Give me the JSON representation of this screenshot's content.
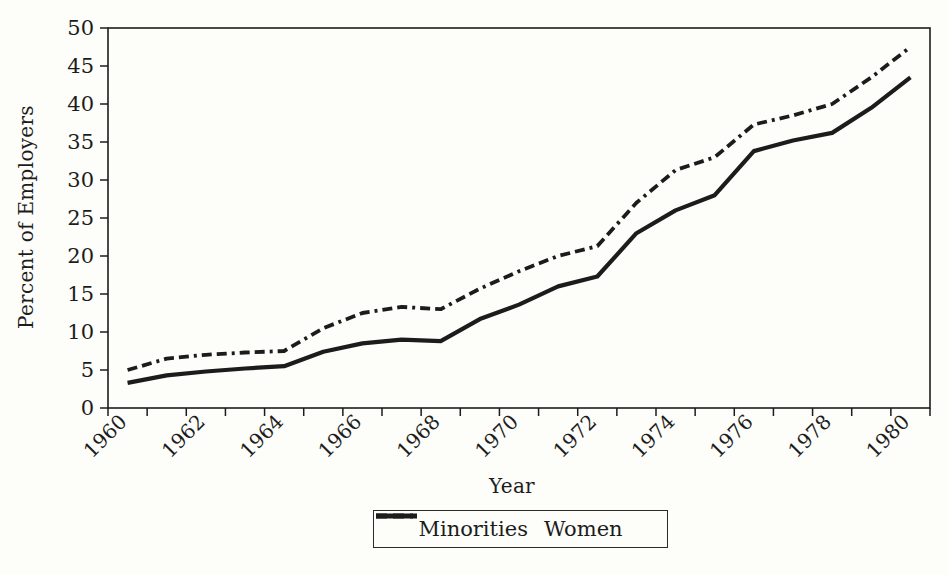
{
  "page": {
    "background": "#fdfdfa",
    "ink_color": "#1c1c1c"
  },
  "chart_data": {
    "type": "line",
    "title": "",
    "xlabel": "Year",
    "ylabel": "Percent of Employers",
    "x": [
      1960,
      1961,
      1962,
      1963,
      1964,
      1965,
      1966,
      1967,
      1968,
      1969,
      1970,
      1971,
      1972,
      1973,
      1974,
      1975,
      1976,
      1977,
      1978,
      1979,
      1980
    ],
    "x_tick_labels": [
      "1960",
      "1962",
      "1964",
      "1966",
      "1968",
      "1970",
      "1972",
      "1974",
      "1976",
      "1978",
      "1980"
    ],
    "xlim": [
      1960,
      1980
    ],
    "ylim": [
      0,
      50
    ],
    "y_ticks": [
      0,
      5,
      10,
      15,
      20,
      25,
      30,
      35,
      40,
      45,
      50
    ],
    "grid": "off",
    "legend_position": "bottom-center",
    "series": [
      {
        "name": "Minorities",
        "line_style": "dashed",
        "color": "#1c1c1c",
        "values": [
          5.0,
          6.5,
          7.0,
          7.3,
          7.5,
          10.5,
          12.5,
          13.3,
          13.0,
          15.7,
          18.0,
          20.0,
          21.3,
          27.0,
          31.3,
          33.0,
          37.3,
          38.5,
          40.0,
          43.5,
          47.5
        ]
      },
      {
        "name": "Women",
        "line_style": "solid",
        "color": "#1c1c1c",
        "values": [
          3.3,
          4.3,
          4.8,
          5.2,
          5.5,
          7.4,
          8.5,
          9.0,
          8.8,
          11.7,
          13.6,
          16.0,
          17.3,
          23.0,
          26.0,
          28.0,
          33.8,
          35.2,
          36.2,
          39.5,
          43.5
        ]
      }
    ]
  },
  "legend": {
    "items": [
      {
        "label": "Minorities",
        "sample": "dash-dash-dot-line"
      },
      {
        "label": "Women",
        "sample": "solid-line"
      }
    ]
  }
}
